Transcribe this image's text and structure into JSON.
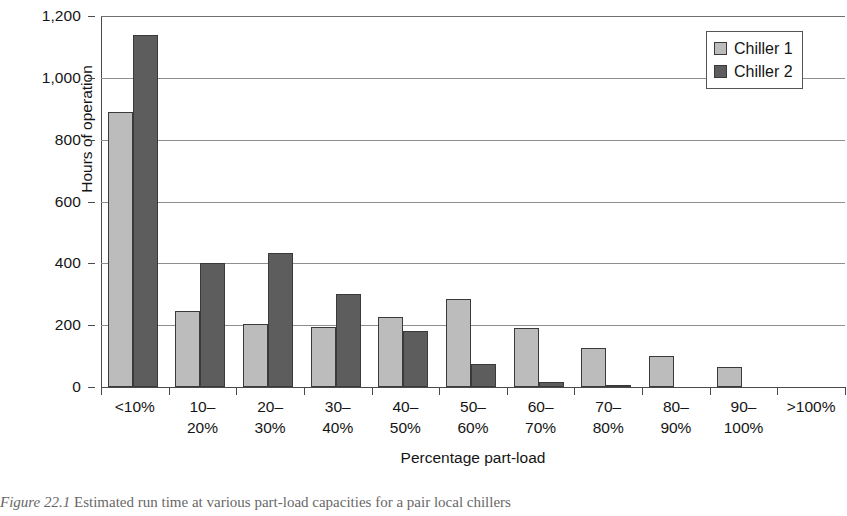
{
  "figure": {
    "caption_prefix": "Figure 22.1",
    "caption_text": " Estimated run time at various part-load capacities for a pair local chillers"
  },
  "legend": {
    "position": "top-right",
    "entries": [
      {
        "label": "Chiller 1",
        "color": "#bcbcbc",
        "swatch": "light-gray-dotted"
      },
      {
        "label": "Chiller 2",
        "color": "#5d5d5d",
        "swatch": "dark-gray-dotted"
      }
    ]
  },
  "axes": {
    "y_title": "Hours of operation",
    "x_title": "Percentage part-load",
    "y_ticks": [
      "0",
      "200",
      "400",
      "600",
      "800",
      "1,000",
      "1,200"
    ]
  },
  "chart_data": {
    "type": "bar",
    "title": "",
    "xlabel": "Percentage part-load",
    "ylabel": "Hours of operation",
    "ylim": [
      0,
      1200
    ],
    "ytick_values": [
      0,
      200,
      400,
      600,
      800,
      1000,
      1200
    ],
    "grid": true,
    "legend_position": "top-right",
    "categories": [
      "<10%",
      "10–\n20%",
      "20–\n30%",
      "30–\n40%",
      "40–\n50%",
      "50–\n60%",
      "60–\n70%",
      "70–\n80%",
      "80–\n90%",
      "90–\n100%",
      ">100%"
    ],
    "series": [
      {
        "name": "Chiller 1",
        "color": "#bcbcbc",
        "values": [
          890,
          245,
          205,
          195,
          225,
          285,
          190,
          125,
          100,
          65,
          0
        ]
      },
      {
        "name": "Chiller 2",
        "color": "#5d5d5d",
        "values": [
          1140,
          400,
          435,
          300,
          180,
          75,
          15,
          3,
          0,
          0,
          0
        ]
      }
    ]
  }
}
